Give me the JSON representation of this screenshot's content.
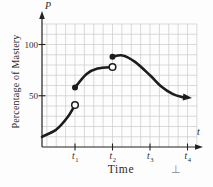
{
  "figure": {
    "p_axis_symbol": "P",
    "t_axis_symbol": "t",
    "x_axis_title": "Time",
    "y_axis_title": "Percentage of Mastery",
    "artifact_mark": "⊥"
  },
  "colors": {
    "curve": "#1c1c1c",
    "axis": "#222222",
    "grid": "#cacaca",
    "text": "#2b2b2b",
    "marker_fill": "#fdfdfd",
    "artifact": "#8a8a8a",
    "background": "#fdfdfd"
  },
  "chart_data": {
    "type": "line",
    "title": "",
    "xlabel": "Time",
    "ylabel": "Percentage of Mastery",
    "x_axis_symbol": "t",
    "y_axis_symbol": "P",
    "xlim": [
      0,
      4.4
    ],
    "ylim": [
      0,
      120
    ],
    "grid": true,
    "grid_step": {
      "x": 0.25,
      "y": 10
    },
    "x_ticks": [
      {
        "base": "t",
        "sub": "1",
        "value": 1
      },
      {
        "base": "t",
        "sub": "2",
        "value": 2
      },
      {
        "base": "t",
        "sub": "3",
        "value": 3
      },
      {
        "base": "t",
        "sub": "4",
        "value": 4
      }
    ],
    "y_ticks": [
      {
        "label": "50",
        "value": 50
      },
      {
        "label": "100",
        "value": 100
      }
    ],
    "segments": [
      {
        "name": "interval-0-to-t1",
        "start_marker": "none",
        "end_marker": "open",
        "points": [
          [
            0.12,
            10
          ],
          [
            0.5,
            17
          ],
          [
            0.8,
            29
          ],
          [
            1.0,
            41
          ]
        ]
      },
      {
        "name": "interval-t1-to-t2",
        "start_marker": "closed",
        "end_marker": "open",
        "points": [
          [
            1.0,
            58
          ],
          [
            1.3,
            71
          ],
          [
            1.6,
            76.5
          ],
          [
            2.0,
            78
          ]
        ]
      },
      {
        "name": "interval-t2-onward",
        "start_marker": "closed",
        "end_marker": "arrow",
        "points": [
          [
            2.0,
            88
          ],
          [
            2.27,
            89.3
          ],
          [
            2.6,
            83
          ],
          [
            3.0,
            70
          ],
          [
            3.3,
            59
          ],
          [
            3.6,
            51.8
          ],
          [
            3.85,
            48.9
          ],
          [
            4.0,
            48.3
          ]
        ]
      }
    ]
  }
}
